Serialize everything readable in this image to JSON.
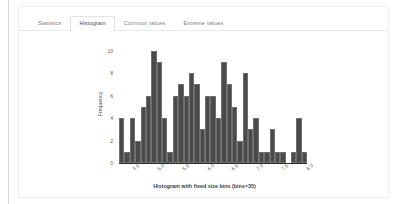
{
  "panel": {
    "tabs": [
      {
        "label": "Statistics",
        "active": false
      },
      {
        "label": "Histogram",
        "active": true
      },
      {
        "label": "Common values",
        "active": false
      },
      {
        "label": "Extreme values",
        "active": false
      }
    ]
  },
  "colors": {
    "bar_fill": "#4a4a4a",
    "bar_edge": "#6f6f6f",
    "axis": "#2b2b2b",
    "tab_active_text": "#44494e",
    "tab_text": "#7c8289",
    "panel_border": "#eceef0"
  },
  "chart_data": {
    "type": "bar",
    "title": "",
    "xlabel": "Histogram with fixed size bins (bins=35)",
    "ylabel": "Frequency",
    "bins": 35,
    "grid": false,
    "legend": null,
    "xlim": [
      4.25,
      8.05
    ],
    "ylim": [
      0,
      10.5
    ],
    "xticks": [
      "4.5",
      "5.0",
      "5.5",
      "6.0",
      "6.5",
      "7.0",
      "7.5",
      "8.0"
    ],
    "xtick_values": [
      4.5,
      5.0,
      5.5,
      6.0,
      6.5,
      7.0,
      7.5,
      8.0
    ],
    "yticks": [
      "0",
      "2",
      "4",
      "6",
      "8",
      "10"
    ],
    "ytick_values": [
      0,
      2,
      4,
      6,
      8,
      10
    ],
    "bin_centers": [
      4.3,
      4.41,
      4.52,
      4.62,
      4.73,
      4.84,
      4.94,
      5.05,
      5.16,
      5.26,
      5.37,
      5.48,
      5.58,
      5.69,
      5.8,
      5.9,
      6.01,
      6.12,
      6.22,
      6.33,
      6.44,
      6.54,
      6.65,
      6.76,
      6.86,
      6.97,
      7.08,
      7.18,
      7.29,
      7.4,
      7.5,
      7.61,
      7.72,
      7.82,
      7.93
    ],
    "values": [
      4,
      1,
      4,
      2,
      5,
      6,
      10,
      9,
      4,
      1,
      6,
      7,
      6,
      8,
      7,
      3,
      6,
      6,
      4,
      9,
      7,
      5,
      2,
      8,
      3,
      4,
      1,
      1,
      3,
      1,
      1,
      0,
      1,
      4,
      1
    ]
  }
}
